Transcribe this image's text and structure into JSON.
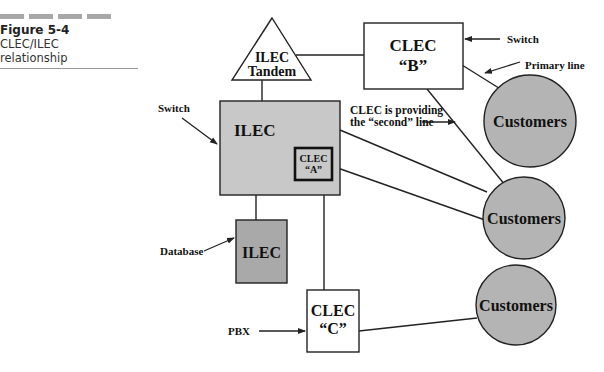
{
  "caption": {
    "figure_label": "Figure 5-4",
    "line1": "CLEC/ILEC",
    "line2": "relationship"
  },
  "nodes": {
    "ilec_tandem": {
      "line1": "ILEC",
      "line2": "Tandem"
    },
    "clec_b": {
      "line1": "CLEC",
      "line2": "“B”"
    },
    "ilec_switch": {
      "label": "ILEC"
    },
    "clec_a": {
      "line1": "CLEC",
      "line2": "“A”"
    },
    "ilec_database": {
      "label": "ILEC"
    },
    "clec_c": {
      "line1": "CLEC",
      "line2": "“C”"
    },
    "customers_1": {
      "label": "Customers"
    },
    "customers_2": {
      "label": "Customers"
    },
    "customers_3": {
      "label": "Customers"
    }
  },
  "annotations": {
    "switch_b": "Switch",
    "primary_line": "Primary line",
    "switch_ilec": "Switch",
    "second_line_1": "CLEC is providing",
    "second_line_2": "the “second” line",
    "database": "Database",
    "pbx": "PBX"
  },
  "colors": {
    "ilec_fill": "#c8c8c8",
    "database_fill": "#a9a9a9",
    "customers_fill": "#b4b4b4",
    "stroke": "#222222"
  }
}
